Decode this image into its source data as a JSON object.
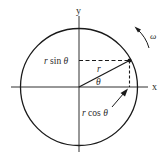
{
  "diagram": {
    "axes": {
      "x_label": "x",
      "y_label": "y"
    },
    "labels": {
      "r_sin_prefix": "r",
      "r_sin_func": " sin ",
      "r_sin_theta": "θ",
      "r_cos_prefix": "r",
      "r_cos_func": " cos ",
      "r_cos_theta": "θ",
      "radius": "r",
      "angle": "θ",
      "omega": "ω"
    },
    "colors": {
      "stroke": "#1a1a1a",
      "background": "#ffffff"
    }
  }
}
